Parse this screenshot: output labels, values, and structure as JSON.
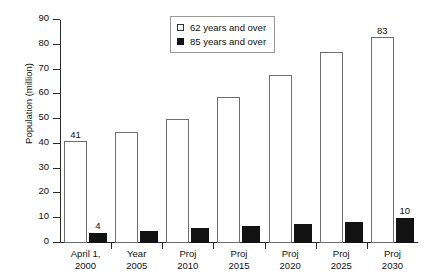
{
  "chart_data": {
    "type": "bar",
    "title": "",
    "xlabel": "",
    "ylabel": "Population (million)",
    "ylim": [
      0,
      90
    ],
    "ytick_step": 10,
    "yticks": [
      0,
      10,
      20,
      30,
      40,
      50,
      60,
      70,
      80,
      90
    ],
    "grid": false,
    "legend_position": "top-center",
    "categories": [
      "April 1,\n2000",
      "Year\n2005",
      "Proj\n2010",
      "Proj\n2015",
      "Proj\n2020",
      "Proj\n2025",
      "Proj\n2030"
    ],
    "category_lines": [
      [
        "April 1,",
        "2000"
      ],
      [
        "Year",
        "2005"
      ],
      [
        "Proj",
        "2010"
      ],
      [
        "Proj",
        "2015"
      ],
      [
        "Proj",
        "2020"
      ],
      [
        "Proj",
        "2025"
      ],
      [
        "Proj",
        "2030"
      ]
    ],
    "series": [
      {
        "name": "62 years and over",
        "style": "open",
        "color": "#ffffff",
        "edge_color": "#6e6e6e",
        "values": [
          41,
          45,
          50,
          59,
          68,
          77,
          83
        ],
        "data_labels": [
          "41",
          "",
          "",
          "",
          "",
          "",
          "83"
        ]
      },
      {
        "name": "85 years and over",
        "style": "filled",
        "color": "#121212",
        "edge_color": "#121212",
        "values": [
          4,
          5,
          6,
          7,
          7.5,
          8.5,
          10
        ],
        "data_labels": [
          "4",
          "",
          "",
          "",
          "",
          "",
          "10"
        ]
      }
    ]
  },
  "legend": {
    "items": [
      {
        "label": "62 years and over",
        "swatch": "open-square"
      },
      {
        "label": "85 years and over",
        "swatch": "filled-square"
      }
    ]
  },
  "axes": {
    "y_title": "Population (million)",
    "y_tick_labels": [
      "0",
      "10",
      "20",
      "30",
      "40",
      "50",
      "60",
      "70",
      "80",
      "90"
    ]
  }
}
